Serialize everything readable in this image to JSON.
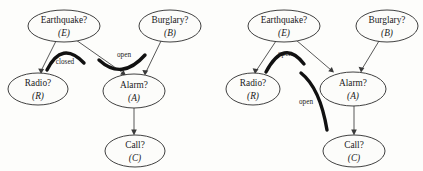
{
  "figure": {
    "background_color": "#fdfdfb",
    "node_fill": "#fcfcfa",
    "node_stroke": "#2b2b2b",
    "edge_color": "#3a3a3a",
    "curve_color": "#111111"
  },
  "diagrams": [
    {
      "id": "left",
      "nodes": [
        {
          "id": "E",
          "label": "Earthquake?",
          "sub": "(E)",
          "cx": 64,
          "cy": 26,
          "rx": 36,
          "ry": 16
        },
        {
          "id": "B",
          "label": "Burglary?",
          "sub": "(B)",
          "cx": 170,
          "cy": 26,
          "rx": 31,
          "ry": 16
        },
        {
          "id": "R",
          "label": "Radio?",
          "sub": "(R)",
          "cx": 38,
          "cy": 89,
          "rx": 30,
          "ry": 16
        },
        {
          "id": "A",
          "label": "Alarm?",
          "sub": "(A)",
          "cx": 134,
          "cy": 91,
          "rx": 31,
          "ry": 17
        },
        {
          "id": "C",
          "label": "Call?",
          "sub": "(C)",
          "cx": 135,
          "cy": 151,
          "rx": 30,
          "ry": 16
        }
      ],
      "edges": [
        {
          "from": "E",
          "to": "R"
        },
        {
          "from": "E",
          "to": "A"
        },
        {
          "from": "B",
          "to": "A"
        },
        {
          "from": "A",
          "to": "C"
        }
      ],
      "annotations": [
        {
          "label": "closed",
          "lx": 65,
          "ly": 62,
          "shape": "arc-up"
        },
        {
          "label": "open",
          "lx": 124,
          "ly": 55,
          "shape": "valley"
        }
      ]
    },
    {
      "id": "right",
      "nodes": [
        {
          "id": "E",
          "label": "Earthquake?",
          "sub": "(E)",
          "cx": 284,
          "cy": 26,
          "rx": 36,
          "ry": 16
        },
        {
          "id": "B",
          "label": "Burglary?",
          "sub": "(B)",
          "cx": 387,
          "cy": 26,
          "rx": 31,
          "ry": 16
        },
        {
          "id": "R",
          "label": "Radio?",
          "sub": "(R)",
          "cx": 253,
          "cy": 89,
          "rx": 27,
          "ry": 16
        },
        {
          "id": "A",
          "label": "Alarm?",
          "sub": "(A)",
          "cx": 353,
          "cy": 89,
          "rx": 33,
          "ry": 17
        },
        {
          "id": "C",
          "label": "Call?",
          "sub": "(C)",
          "cx": 354,
          "cy": 151,
          "rx": 31,
          "ry": 16
        }
      ],
      "edges": [
        {
          "from": "E",
          "to": "R"
        },
        {
          "from": "E",
          "to": "A"
        },
        {
          "from": "B",
          "to": "A"
        },
        {
          "from": "A",
          "to": "C"
        }
      ],
      "annotations": [
        {
          "label": "open",
          "lx": 285,
          "ly": 54,
          "shape": "hill"
        },
        {
          "label": "open",
          "lx": 306,
          "ly": 102,
          "shape": "vertical-bend"
        }
      ]
    }
  ]
}
